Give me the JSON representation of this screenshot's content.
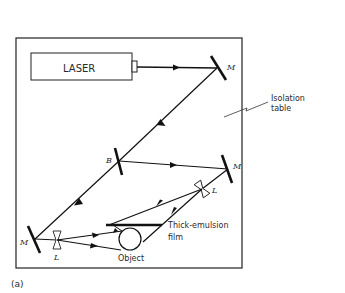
{
  "diagram": {
    "panel_label": "(a)",
    "components": {
      "laser": {
        "label": "LASER"
      },
      "mirror_top": {
        "label": "M"
      },
      "beam_splitter": {
        "label": "B"
      },
      "mirror_right": {
        "label": "M"
      },
      "lens_right": {
        "label": "L"
      },
      "mirror_left": {
        "label": "M"
      },
      "lens_left": {
        "label": "L"
      },
      "film": {
        "label_line1": "Thick-emulsion",
        "label_line2": "film"
      },
      "object": {
        "label": "Object"
      },
      "table": {
        "label_line1": "Isolation",
        "label_line2": "table"
      }
    },
    "colors": {
      "line": "#111111",
      "text": "#2a2a2a",
      "background": "#ffffff"
    }
  }
}
